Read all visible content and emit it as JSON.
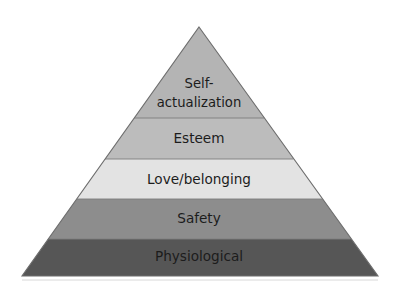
{
  "figure": {
    "type": "pyramid-diagram",
    "background_color": "#ffffff",
    "outline_color": "#6d6d6d",
    "text_color": "#1c1c1c"
  },
  "pyramid": {
    "apex": {
      "x": 199,
      "y": 27
    },
    "base_left": {
      "x": 22,
      "y": 276
    },
    "base_right": {
      "x": 378,
      "y": 276
    },
    "tiers": [
      {
        "id": "self-actualization",
        "label": "Self-actualization",
        "label_line1": "Self-",
        "label_line2": "actualization",
        "level": 5,
        "color": "#b4b4b4",
        "top_y": 27,
        "bottom_y": 118,
        "label_x": 199,
        "label_y1": 84,
        "label_y2": 103
      },
      {
        "id": "esteem",
        "label": "Esteem",
        "level": 4,
        "color": "#bcbcbc",
        "top_y": 118,
        "bottom_y": 159,
        "label_x": 199,
        "label_y": 139
      },
      {
        "id": "love-belonging",
        "label": "Love/belonging",
        "level": 3,
        "color": "#e3e3e3",
        "top_y": 159,
        "bottom_y": 199,
        "label_x": 199,
        "label_y": 180
      },
      {
        "id": "safety",
        "label": "Safety",
        "level": 2,
        "color": "#8d8d8d",
        "top_y": 199,
        "bottom_y": 239,
        "label_x": 199,
        "label_y": 219
      },
      {
        "id": "physiological",
        "label": "Physiological",
        "level": 1,
        "color": "#565656",
        "top_y": 239,
        "bottom_y": 276,
        "label_x": 199,
        "label_y": 257
      }
    ]
  }
}
